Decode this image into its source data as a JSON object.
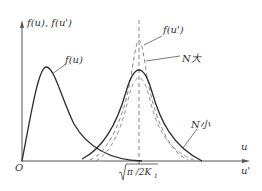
{
  "diagram": {
    "y_axis_label": "f(u), f(u')",
    "x_axis_label_top": "u",
    "x_axis_label_bottom": "u'",
    "origin_label": "O",
    "x_tick_label": "√(π/2K₁)",
    "x_tick_label_parts": {
      "radical": "√",
      "body": "π /2K",
      "subscript": "1"
    },
    "curves": [
      {
        "id": "f_u",
        "label": "f(u)",
        "style": "solid",
        "description": "skewed peak near origin"
      },
      {
        "id": "f_u_prime",
        "label": "f(u')",
        "style": "dashed",
        "description": "sharp peak at √(π/2K₁)"
      },
      {
        "id": "n_large",
        "label": "N大",
        "style": "solid",
        "description": "peak at √(π/2K₁) for large N"
      },
      {
        "id": "n_small",
        "label": "N小",
        "style": "dashed",
        "description": "broad curve for small N"
      }
    ],
    "colors": {
      "line": "#2b2b2b",
      "dashed": "#7a7a7a",
      "axis": "#555555",
      "text": "#333333"
    }
  }
}
